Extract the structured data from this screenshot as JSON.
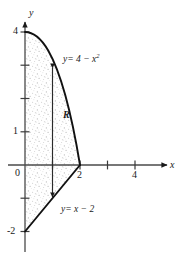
{
  "figure": {
    "kind": "math-graph",
    "background": "#ffffff",
    "ink_color": "#1a1a1a",
    "shade_color": "#b9b9b9"
  },
  "axes": {
    "x_axis_name": "x",
    "y_axis_name": "y",
    "origin_label": "0",
    "x_ticks": [
      {
        "value": 1,
        "label": ""
      },
      {
        "value": 2,
        "label": "2"
      },
      {
        "value": 3,
        "label": ""
      },
      {
        "value": 4,
        "label": "4"
      }
    ],
    "y_ticks": [
      {
        "value": 1,
        "label": "1"
      },
      {
        "value": 2,
        "label": ""
      },
      {
        "value": 3,
        "label": ""
      },
      {
        "value": 4,
        "label": "4"
      },
      {
        "value": -1,
        "label": ""
      },
      {
        "value": -2,
        "label": "-2"
      }
    ],
    "x_range": [
      -0.55,
      5.3
    ],
    "y_range": [
      -2.65,
      4.9
    ]
  },
  "curves": {
    "parabola": {
      "label_y": "y",
      "label_eq": "= 4 − x",
      "label_exp": "2",
      "full_text": "y = 4 − x²",
      "from_x": 0,
      "to_x": 2
    },
    "line": {
      "label_y": "y",
      "label_eq": "= x − 2",
      "full_text": "y = x − 2",
      "from_x": 0,
      "to_x": 2
    }
  },
  "region": {
    "label": "R",
    "fill": "stipple"
  },
  "sample_strip": {
    "x": 1.0,
    "top_y": 3.0,
    "bottom_y": -1.0
  }
}
